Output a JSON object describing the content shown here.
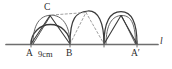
{
  "figure": {
    "kind": "geometry-diagram",
    "width": 172,
    "height": 69,
    "background": "#ffffff",
    "stroke_color": "#3a3a3a",
    "dashed_color": "#8a8a8a",
    "baseline_color": "#6e6e6e"
  },
  "labels": {
    "vertex_c": "C",
    "vertex_a": "A",
    "vertex_b": "B",
    "vertex_a_prime": "A′",
    "dimension_ab": "9cm",
    "line_name": "l"
  },
  "geometry": {
    "baseline": {
      "y": 44,
      "x_start": 6,
      "x_end": 162
    },
    "points": {
      "A": {
        "x": 31,
        "y": 44
      },
      "B": {
        "x": 70,
        "y": 44
      },
      "M": {
        "x": 104,
        "y": 44
      },
      "Ap": {
        "x": 137,
        "y": 44
      },
      "C": {
        "x": 50,
        "y": 15
      },
      "P2": {
        "x": 84,
        "y": 12
      },
      "P3": {
        "x": 121,
        "y": 15
      }
    },
    "arcs": [
      {
        "name": "arc-A-B",
        "from": "A",
        "to": "B",
        "peak_y": 14,
        "style": "solid"
      },
      {
        "name": "arc-B-M",
        "from": "B",
        "to": "M",
        "peak_y": 11,
        "style": "solid"
      },
      {
        "name": "arc-M-Ap",
        "from": "M",
        "to": "Ap",
        "peak_y": 13,
        "style": "solid"
      }
    ],
    "chords": [
      {
        "name": "chord-A-C",
        "style": "solid"
      },
      {
        "name": "chord-C-B",
        "style": "solid"
      },
      {
        "name": "chord-A-B-arcinner",
        "style": "solid"
      },
      {
        "name": "chord-B-P2",
        "style": "dashed"
      },
      {
        "name": "chord-P2-M",
        "style": "dashed"
      },
      {
        "name": "chord-M-P3",
        "style": "solid"
      },
      {
        "name": "chord-P3-Ap",
        "style": "solid"
      }
    ]
  }
}
